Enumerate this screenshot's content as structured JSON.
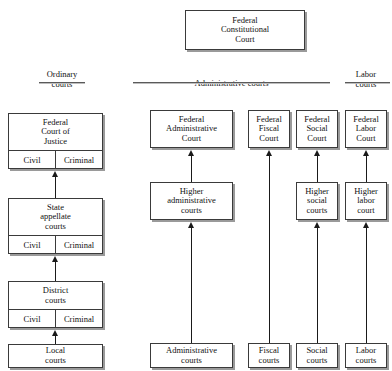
{
  "diagram": {
    "columns": [
      {
        "id": "ordinary",
        "label": "Ordinary\ncourts"
      },
      {
        "id": "administrative",
        "label": "Administrative courts"
      },
      {
        "id": "labor",
        "label": "Labor\ncourts"
      }
    ],
    "apex": {
      "label": "Federal\nConstitutional\nCourt"
    },
    "ordinary_branch": {
      "levels": [
        {
          "id": "federal-court-of-justice",
          "label": "Federal\nCourt of\nJustice",
          "divisions": [
            "Civil",
            "Criminal"
          ]
        },
        {
          "id": "state-appellate-courts",
          "label": "State\nappellate\ncourts",
          "divisions": [
            "Civil",
            "Criminal"
          ]
        },
        {
          "id": "district-courts",
          "label": "District\ncourts",
          "divisions": [
            "Civil",
            "Criminal"
          ]
        },
        {
          "id": "local-courts",
          "label": "Local\ncourts",
          "divisions": []
        }
      ]
    },
    "administrative_branch": {
      "levels": [
        {
          "id": "federal-administrative-court",
          "label": "Federal\nAdministrative\nCourt"
        },
        {
          "id": "higher-administrative-courts",
          "label": "Higher\nadministrative\ncourts"
        },
        {
          "id": "administrative-courts",
          "label": "Administrative\ncourts"
        }
      ]
    },
    "fiscal_branch": {
      "levels": [
        {
          "id": "federal-fiscal-court",
          "label": "Federal\nFiscal\nCourt"
        },
        {
          "id": "fiscal-courts",
          "label": "Fiscal\ncourts"
        }
      ]
    },
    "social_branch": {
      "levels": [
        {
          "id": "federal-social-court",
          "label": "Federal\nSocial\nCourt"
        },
        {
          "id": "higher-social-courts",
          "label": "Higher\nsocial\ncourts"
        },
        {
          "id": "social-courts",
          "label": "Social\ncourts"
        }
      ]
    },
    "labor_branch": {
      "levels": [
        {
          "id": "federal-labor-court",
          "label": "Federal\nLabor\nCourt"
        },
        {
          "id": "higher-labor-court",
          "label": "Higher\nlabor\ncourt"
        },
        {
          "id": "labor-courts",
          "label": "Labor\ncourts"
        }
      ]
    },
    "colors": {
      "box_border": "#3a3a3a",
      "box_shadow": "#9a9a9a",
      "connector": "#1a1a1a",
      "rule": "#5a5a5a",
      "text": "#111111",
      "background": "#ffffff"
    }
  }
}
